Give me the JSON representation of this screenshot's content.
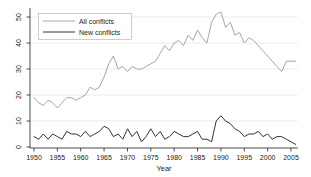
{
  "chart_data": {
    "type": "line",
    "title": "",
    "xlabel": "Year",
    "ylabel": "",
    "grid": "horizontal-light",
    "legend_position": "top-left-inside",
    "xlim": [
      1949,
      2007
    ],
    "ylim": [
      0,
      53
    ],
    "x_ticks": [
      1950,
      1955,
      1960,
      1965,
      1970,
      1975,
      1980,
      1985,
      1990,
      1995,
      2000,
      2005
    ],
    "y_ticks": [
      0,
      10,
      20,
      30,
      40,
      50
    ],
    "years": [
      1950,
      1951,
      1952,
      1953,
      1954,
      1955,
      1956,
      1957,
      1958,
      1959,
      1960,
      1961,
      1962,
      1963,
      1964,
      1965,
      1966,
      1967,
      1968,
      1969,
      1970,
      1971,
      1972,
      1973,
      1974,
      1975,
      1976,
      1977,
      1978,
      1979,
      1980,
      1981,
      1982,
      1983,
      1984,
      1985,
      1986,
      1987,
      1988,
      1989,
      1990,
      1991,
      1992,
      1993,
      1994,
      1995,
      1996,
      1997,
      1998,
      1999,
      2000,
      2001,
      2002,
      2003,
      2004,
      2005,
      2006
    ],
    "series": [
      {
        "name": "All conflicts",
        "color": "#a6a6a6",
        "values": [
          19,
          17,
          16,
          18,
          17,
          15,
          17,
          19,
          19,
          18,
          19,
          20,
          23,
          22,
          23,
          27,
          32,
          35,
          30,
          31,
          29,
          31,
          30,
          30,
          31,
          32,
          33,
          36,
          39,
          37,
          40,
          41,
          39,
          43,
          41,
          45,
          42,
          40,
          48,
          51,
          52,
          46,
          48,
          43,
          44,
          40,
          42,
          41,
          39,
          37,
          35,
          33,
          31,
          29,
          33,
          33,
          33
        ]
      },
      {
        "name": "New conflicts",
        "color": "#333333",
        "values": [
          4,
          3,
          5,
          3,
          5,
          4,
          3,
          6,
          5,
          5,
          4,
          6,
          4,
          5,
          6,
          8,
          7,
          4,
          5,
          3,
          7,
          4,
          6,
          2,
          4,
          7,
          4,
          6,
          3,
          4,
          6,
          5,
          4,
          4,
          5,
          6,
          3,
          3,
          2,
          10,
          12,
          10,
          9,
          7,
          6,
          4,
          5,
          5,
          6,
          4,
          5,
          3,
          4,
          4,
          3,
          2,
          1
        ]
      }
    ]
  },
  "colors": {
    "background": "#ffffff",
    "axis": "#000000",
    "grid": "#e3e3e3",
    "text": "#1a1a1a",
    "legend_border": "#b8b8b8"
  }
}
